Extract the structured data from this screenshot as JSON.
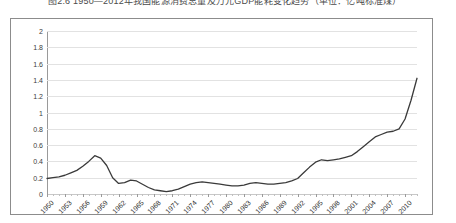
{
  "caption": {
    "text": "图2.6  1950—2012年我国能源消费总量及万元GDP能耗变化趋势（单位：亿吨标准煤）",
    "note": "top-cropped caption line"
  },
  "colors": {
    "line": "#3a3a3a",
    "gridline": "#e2e2e2",
    "axis": "#9a9a9a",
    "frame": "#8c8c8c",
    "plot_background": "#ffffff",
    "tick_text": "#2e2e2e"
  },
  "chart_data": {
    "type": "line",
    "title": "",
    "xlabel": "",
    "ylabel": "",
    "ylim": [
      0,
      2
    ],
    "xlim": [
      1950,
      2012
    ],
    "grid": true,
    "legend": false,
    "ytick_labels": [
      "0",
      "0.2",
      "0.4",
      "0.6",
      "0.8",
      "1",
      "1.2",
      "1.4",
      "1.6",
      "1.8",
      "2"
    ],
    "ytick_values": [
      0,
      0.2,
      0.4,
      0.6,
      0.8,
      1,
      1.2,
      1.4,
      1.6,
      1.8,
      2
    ],
    "xtick_labels": [
      "1950",
      "1953",
      "1956",
      "1959",
      "1962",
      "1965",
      "1968",
      "1971",
      "1974",
      "1977",
      "1980",
      "1983",
      "1986",
      "1989",
      "1992",
      "1995",
      "1998",
      "2001",
      "2004",
      "2007",
      "2010"
    ],
    "xtick_values": [
      1950,
      1953,
      1956,
      1959,
      1962,
      1965,
      1968,
      1971,
      1974,
      1977,
      1980,
      1983,
      1986,
      1989,
      1992,
      1995,
      1998,
      2001,
      2004,
      2007,
      2010
    ],
    "series": [
      {
        "name": "能源消费总量",
        "x": [
          1950,
          1951,
          1952,
          1953,
          1954,
          1955,
          1956,
          1957,
          1958,
          1959,
          1960,
          1961,
          1962,
          1963,
          1964,
          1965,
          1966,
          1967,
          1968,
          1969,
          1970,
          1971,
          1972,
          1973,
          1974,
          1975,
          1976,
          1977,
          1978,
          1979,
          1980,
          1981,
          1982,
          1983,
          1984,
          1985,
          1986,
          1987,
          1988,
          1989,
          1990,
          1991,
          1992,
          1993,
          1994,
          1995,
          1996,
          1997,
          1998,
          1999,
          2000,
          2001,
          2002,
          2003,
          2004,
          2005,
          2006,
          2007,
          2008,
          2009,
          2010,
          2011,
          2012
        ],
        "values": [
          0.19,
          0.2,
          0.21,
          0.23,
          0.26,
          0.29,
          0.34,
          0.4,
          0.47,
          0.44,
          0.35,
          0.2,
          0.13,
          0.14,
          0.17,
          0.16,
          0.12,
          0.08,
          0.05,
          0.04,
          0.03,
          0.04,
          0.06,
          0.09,
          0.12,
          0.14,
          0.15,
          0.14,
          0.13,
          0.12,
          0.11,
          0.1,
          0.1,
          0.11,
          0.13,
          0.14,
          0.13,
          0.12,
          0.12,
          0.13,
          0.14,
          0.16,
          0.19,
          0.26,
          0.33,
          0.39,
          0.42,
          0.41,
          0.42,
          0.43,
          0.45,
          0.47,
          0.52,
          0.58,
          0.64,
          0.7,
          0.73,
          0.76,
          0.77,
          0.8,
          0.92,
          1.15,
          1.42
        ]
      }
    ]
  }
}
